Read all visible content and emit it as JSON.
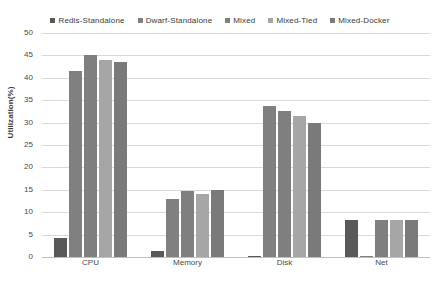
{
  "chart_data": {
    "type": "bar",
    "title": "",
    "subtitle": "",
    "xlabel": "",
    "ylabel": "Utilization(%)",
    "categories": [
      "CPU",
      "Memory",
      "Disk",
      "Net"
    ],
    "ylim": [
      0,
      50
    ],
    "ytick_step": 5,
    "yticks": [
      0,
      5,
      10,
      15,
      20,
      25,
      30,
      35,
      40,
      45,
      50
    ],
    "ytick_labels": [
      "0",
      "5",
      "10",
      "15",
      "20",
      "25",
      "30",
      "35",
      "40",
      "45",
      "50"
    ],
    "grid": true,
    "grid_axis": "y",
    "legend_position": "top",
    "orientation": "vertical",
    "series": [
      {
        "name": "Redis-Standalone",
        "color": "#595959",
        "values": [
          4.3,
          1.4,
          0.2,
          8.2
        ]
      },
      {
        "name": "Dwarf-Standalone",
        "color": "#808080",
        "values": [
          41.5,
          13.0,
          33.6,
          0.2
        ]
      },
      {
        "name": "Mixed",
        "color": "#7f7f7f",
        "values": [
          45.0,
          14.8,
          32.6,
          8.2
        ]
      },
      {
        "name": "Mixed-Tied",
        "color": "#a6a6a6",
        "values": [
          44.0,
          14.0,
          31.5,
          8.2
        ]
      },
      {
        "name": "Mixed-Docker",
        "color": "#7a7a7a",
        "values": [
          43.5,
          15.0,
          30.0,
          8.2
        ]
      }
    ]
  },
  "legend": {
    "marker_glyph": "square",
    "entries": [
      {
        "label": "Redis-Standalone",
        "color": "#595959"
      },
      {
        "label": "Dwarf-Standalone",
        "color": "#808080"
      },
      {
        "label": "Mixed",
        "color": "#7f7f7f"
      },
      {
        "label": "Mixed-Tied",
        "color": "#a6a6a6"
      },
      {
        "label": "Mixed-Docker",
        "color": "#7a7a7a"
      }
    ]
  },
  "style": {
    "background": "#ffffff",
    "gridline_color": "#d9d9d9",
    "axis_line_color": "#bfbfbf",
    "text_color": "#4a4a4a"
  }
}
